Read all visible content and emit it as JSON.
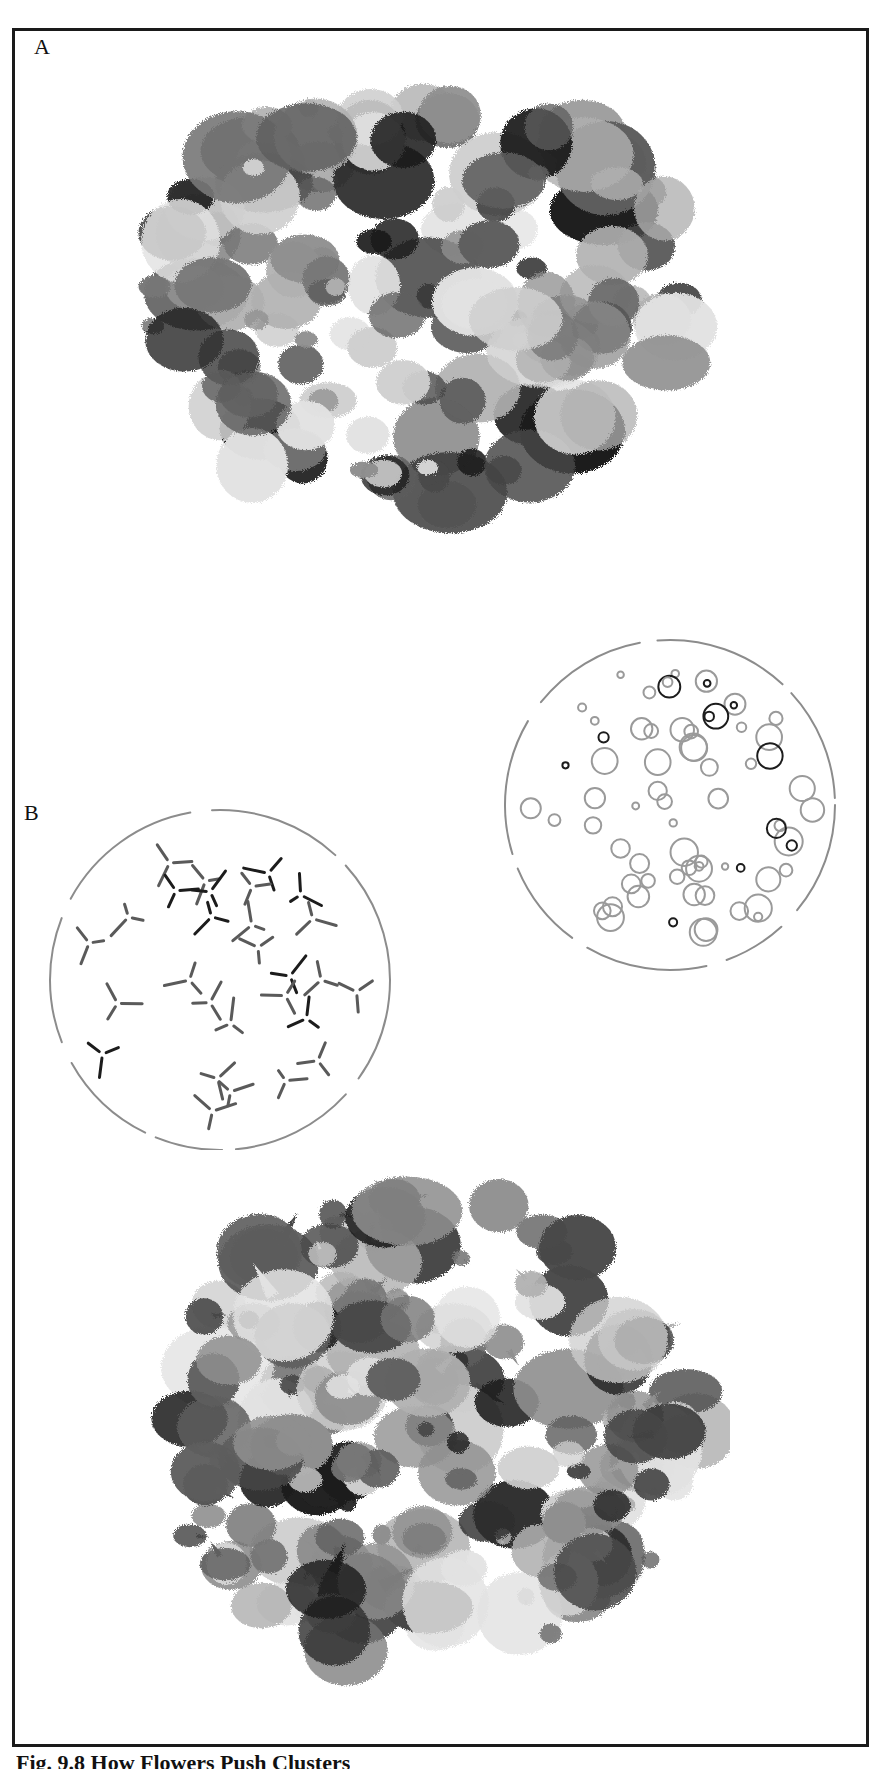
{
  "figure": {
    "panels": [
      {
        "id": "A",
        "label": "A",
        "description": "Watercolor cluster of overlapping circular blobs in varied gray values (light to near-black)"
      },
      {
        "id": "B",
        "label": "B",
        "description": "Two circle diagrams: left with dashed short strokes meeting in Y-junctions; right with outlined circles of varied darkness; below, a watercolor cluster of overlapping blobs with pointed tails"
      }
    ],
    "caption": "Fig. 9.8 How Flowers Push Clusters"
  },
  "colors": {
    "border": "#1a1a1a",
    "ink_dark": "#1c1c1c",
    "ink_mid": "#5a5a5a",
    "ink_light": "#9a9a9a",
    "ink_pale": "#d6d6d6",
    "line_gray": "#8c8c8c"
  }
}
